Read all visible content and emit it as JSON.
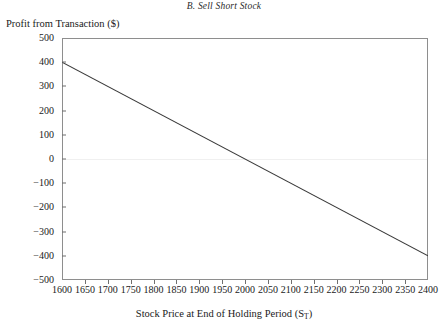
{
  "chart_data": {
    "type": "line",
    "title": "B. Sell Short Stock",
    "xlabel": "Stock Price at End of Holding Period (S",
    "xlabel_sub": "T",
    "xlabel_suffix": ")",
    "ylabel": "Profit from Transaction ($)",
    "xlim": [
      1600,
      2400
    ],
    "ylim": [
      -500,
      500
    ],
    "grid": false,
    "legend": "none",
    "xticks": [
      1600,
      1650,
      1700,
      1750,
      1800,
      1850,
      1900,
      1950,
      2000,
      2050,
      2100,
      2150,
      2200,
      2250,
      2300,
      2350,
      2400
    ],
    "xtick_labels": [
      "1600",
      "1650",
      "1700",
      "1750",
      "1800",
      "1850",
      "1900",
      "1950",
      "2000",
      "2050",
      "2100",
      "2150",
      "2200",
      "2250",
      "2300",
      "2350",
      "2400"
    ],
    "yticks": [
      500,
      400,
      300,
      200,
      100,
      0,
      -100,
      -200,
      -300,
      -400,
      -500
    ],
    "ytick_labels": [
      "500",
      "400",
      "300",
      "200",
      "100",
      "0",
      "−100",
      "−200",
      "−300",
      "−400",
      "−500"
    ],
    "series": [
      {
        "name": "Profit from short stock",
        "color": "#3a3a3a",
        "x": [
          1600,
          2400
        ],
        "values": [
          400,
          -400
        ],
        "breakeven_x": 2000
      }
    ],
    "zero_line": 0,
    "line_color": "#3a3a3a",
    "axis_color": "#8e8e8e",
    "gridline_color": "#f0f0f0",
    "background": "#ffffff"
  }
}
